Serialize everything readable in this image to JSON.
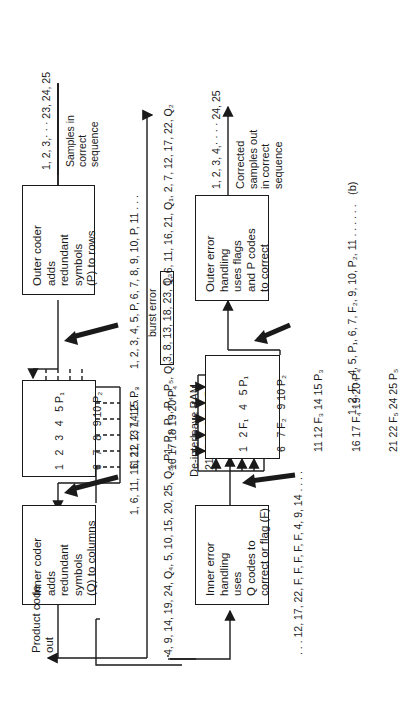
{
  "figure_label": "(b)",
  "encoder": {
    "input_sequence": "1, 2, 3,· · · 23, 24, 25",
    "input_label_lines": [
      "Samples in",
      "correct",
      "sequence"
    ],
    "outer_coder": {
      "lines": [
        "Outer coder",
        "adds",
        "redundant",
        "symbols",
        "(P) to rows"
      ]
    },
    "row_sequence": "1, 2, 3, 4, 5, P, 6, 7, 8, 9, 10, P, 11 . . .",
    "matrix": {
      "rows": [
        "1   2   3   4   5 P₁",
        "6   7   8   9 10 P₂",
        "11 12 13 14 15 P₃",
        "16 17 18 19 20 P₄",
        "21 22 23 24 25 P₅"
      ]
    },
    "column_sequence": "1, 6, 11, 16, 21, 2, 7, 12 . . .",
    "inner_coder": {
      "lines": [
        "Inner coder",
        "adds",
        "redundant",
        "symbols",
        "(Q) to columns"
      ]
    },
    "output_label_lines": [
      "Product code",
      "out"
    ]
  },
  "channel": {
    "transmitted_sequence_start": "1, 6, 11, 16, 21, Q₁, 2, 7, 12, 17, 22, Q₂",
    "burst_error_label": "burst error",
    "burst_error_symbols": "3, 8, 13, 18, 23, Q₃",
    "transmitted_sequence_end": "4, 9, 14, 19, 24, Q₄, 5, 10, 15, 20, 25, Q₅, P1, P₂, P₃, P₄, P₅, Q₆"
  },
  "decoder": {
    "inner_error_handling": {
      "lines": [
        "Inner error",
        "handling",
        "uses",
        "Q codes to",
        "correct or flag (F)"
      ]
    },
    "flagged_sequence": ". . . 12, 17, 22, F, F, F, F, F, 4, 9, 14 . . . .",
    "deinterleave_label": "De-interleave RAM",
    "matrix": {
      "rows": [
        "1   2 F₁   4   5 P₁",
        "6   7 F₂   9 10 P₂",
        "11 12 F₃ 14 15 P₃",
        "16 17 F₄ 19 20 P₄",
        "21 22 F₅ 24 25 P₅"
      ]
    },
    "row_sequence": "1, 2, F₁, 4, 5, P₁, 6, 7, F₂, 9, 10, P₂, 11 . . . . . .",
    "outer_error_handling": {
      "lines": [
        "Outer error",
        "handling",
        "uses flags",
        "and P codes",
        "to correct"
      ]
    },
    "output_sequence": "1, 2, 3, 4,· · · · 24, 25",
    "output_label_lines": [
      "Corrected",
      "samples out",
      "in correct",
      "sequence"
    ]
  },
  "colors": {
    "ink": "#1a1a1a",
    "background": "#ffffff"
  }
}
